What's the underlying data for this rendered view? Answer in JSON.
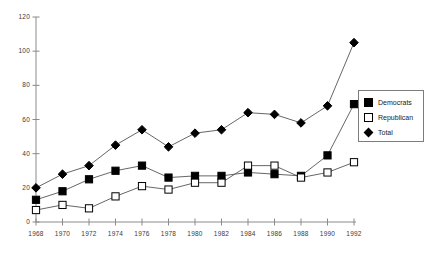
{
  "chart_data": {
    "type": "line",
    "title": "",
    "subtitle": "",
    "xlabel": "",
    "ylabel": "",
    "xlim": [
      1968,
      1992
    ],
    "ylim": [
      0,
      120
    ],
    "grid": false,
    "legend_position": "right",
    "categories": [
      1968,
      1970,
      1972,
      1974,
      1976,
      1978,
      1980,
      1982,
      1984,
      1986,
      1988,
      1990,
      1992
    ],
    "x_tick_labels": [
      "1968",
      "1970",
      "1972",
      "1974",
      "1976",
      "1978",
      "1980",
      "1982",
      "1984",
      "1986",
      "1988",
      "1990",
      "1992"
    ],
    "y_tick_labels": [
      "0",
      "20",
      "40",
      "60",
      "80",
      "100",
      "120"
    ],
    "y_ticks": [
      0,
      20,
      40,
      60,
      80,
      100,
      120
    ],
    "series": [
      {
        "name": "Democrats",
        "marker": "filled-square",
        "color": "#000000",
        "values": [
          13,
          18,
          25,
          30,
          33,
          26,
          27,
          27,
          29,
          28,
          27,
          39,
          69
        ]
      },
      {
        "name": "Republican",
        "marker": "open-square",
        "color": "#000000",
        "values": [
          7,
          10,
          8,
          15,
          21,
          19,
          23,
          23,
          33,
          33,
          26,
          29,
          35
        ]
      },
      {
        "name": "Total",
        "marker": "filled-diamond",
        "color": "#000000",
        "values": [
          20,
          28,
          33,
          45,
          54,
          44,
          52,
          54,
          64,
          63,
          58,
          68,
          105
        ]
      }
    ]
  },
  "legend": {
    "items": [
      {
        "label": "Democrats",
        "key": "filled-square"
      },
      {
        "label": "Republican",
        "key": "open-square"
      },
      {
        "label": "Total",
        "key": "filled-diamond"
      }
    ]
  }
}
